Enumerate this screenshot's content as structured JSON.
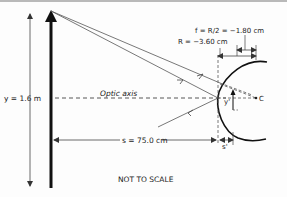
{
  "diagram": {
    "type": "convex-mirror-ray-diagram",
    "labels": {
      "object_height": "y = 1.6 m",
      "optic_axis": "Optic axis",
      "focal_length": "f = R/2 = −1.80 cm",
      "radius": "R = −3.60 cm",
      "object_distance": "s = 75.0 cm",
      "image_distance": "s'",
      "image_height": "y'",
      "center_of_curvature": "C",
      "note": "NOT TO SCALE"
    },
    "colors": {
      "line": "#333333",
      "object_arrow": "#111111",
      "background": "#fdfdfd",
      "top_border": "#b9b9b9"
    }
  }
}
